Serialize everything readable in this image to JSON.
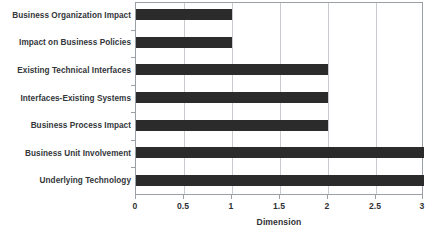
{
  "chart_data": {
    "type": "bar",
    "orientation": "horizontal",
    "title": "",
    "xlabel": "Dimension",
    "ylabel": "",
    "categories": [
      "Business Organization Impact",
      "Impact on Business Policies",
      "Existing Technical Interfaces",
      "Interfaces-Existing Systems",
      "Business Process Impact",
      "Business Unit Involvement",
      "Underlying Technology"
    ],
    "values": [
      1,
      1,
      2,
      2,
      2,
      3,
      3
    ],
    "xlim": [
      0,
      3
    ],
    "xticks": [
      0,
      0.5,
      1,
      1.5,
      2,
      2.5,
      3
    ],
    "xtick_labels": [
      "0",
      "0.5",
      "1",
      "1.5",
      "2",
      "2.5",
      "3"
    ],
    "grid": "vertical",
    "legend": "none",
    "bar_color": "#2b2b2b",
    "grid_color": "#c8ccd0",
    "axis_color": "#9aa0a6",
    "background_color": "#ffffff",
    "label_color": "#33363a"
  }
}
